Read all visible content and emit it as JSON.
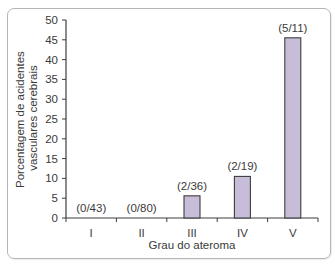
{
  "chart_data": {
    "type": "bar",
    "title": "",
    "xlabel": "Grau do ateroma",
    "ylabel": "Porcentagem de acidentes vasculares cerebrais",
    "ylabel_lines": [
      "Porcentagem de acidentes",
      "vasculares cerebrais"
    ],
    "categories": [
      "I",
      "II",
      "III",
      "IV",
      "V"
    ],
    "values": [
      0,
      0,
      5.6,
      10.5,
      45.5
    ],
    "annotations": [
      "(0/43)",
      "(0/80)",
      "(2/36)",
      "(2/19)",
      "(5/11)"
    ],
    "ylim": [
      0,
      50
    ],
    "yticks": [
      0,
      5,
      10,
      15,
      20,
      25,
      30,
      35,
      40,
      45,
      50
    ],
    "grid": false,
    "legend": null,
    "colors": {
      "bar_fill": "#c8bdd9",
      "bar_stroke": "#3d3d3d",
      "axis": "#3d3d3d",
      "frame": "#b5b5b5"
    }
  }
}
